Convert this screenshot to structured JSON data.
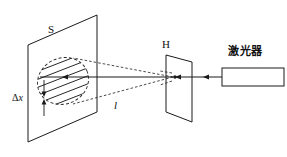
{
  "figure": {
    "width": 287,
    "height": 157,
    "background_color": "#ffffff",
    "line_color": "#1a1a1a"
  },
  "labels": {
    "screen": "S",
    "slit_plate": "H",
    "laser": "激光器",
    "distance": "l",
    "fringe_spacing_delta": "Δ",
    "fringe_spacing_var": "x"
  },
  "components": [
    {
      "id": "screen",
      "name": "observation-screen",
      "label": "S",
      "shape": "parallelogram"
    },
    {
      "id": "fringes",
      "name": "interference-fringe-pattern",
      "shape": "ellipse-with-stripes",
      "stripe_count": 7
    },
    {
      "id": "slit-plate",
      "name": "double-slit-plate",
      "label": "H",
      "shape": "parallelogram"
    },
    {
      "id": "laser",
      "name": "laser-source",
      "label": "激光器",
      "shape": "rectangle"
    },
    {
      "id": "beam",
      "name": "laser-beam-axis",
      "shape": "line-with-arrows"
    },
    {
      "id": "rays",
      "name": "diffracted-ray-envelope",
      "shape": "dashed-lines"
    }
  ],
  "measurements": {
    "fringe_spacing_label": "Δx",
    "slit_to_screen_label": "l"
  }
}
